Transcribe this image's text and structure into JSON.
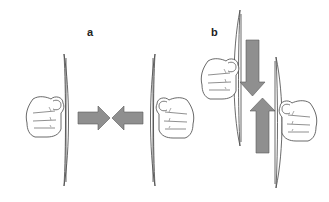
{
  "figure": {
    "panels": [
      {
        "label": "a",
        "description": "Two hands pressing discs toward each other (compression)",
        "arrows": [
          "arrow-right",
          "arrow-left"
        ]
      },
      {
        "label": "b",
        "description": "Two hands sliding discs past each other (shear)",
        "arrows": [
          "arrow-down",
          "arrow-up"
        ]
      }
    ],
    "colors": {
      "arrow_fill": "#8f8f8f",
      "arrow_stroke": "#5a5a5a",
      "line": "#444444",
      "background": "#ffffff"
    }
  }
}
